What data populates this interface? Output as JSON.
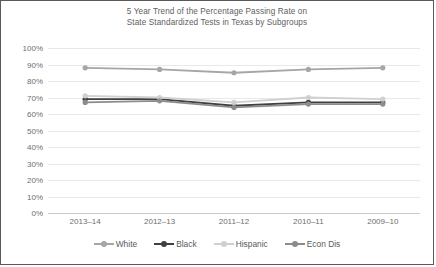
{
  "chart_data": {
    "type": "line",
    "title": "5 Year Trend of the Percentage Passing Rate on State Standardized Tests in Texas by Subgroups",
    "title_line1": "5 Year Trend of the Percentage Passing Rate on",
    "title_line2": "State Standardized Tests in Texas by Subgroups",
    "xlabel": "",
    "ylabel": "",
    "categories": [
      "2013–14",
      "2012–13",
      "2011–12",
      "2010–11",
      "2009–10"
    ],
    "ylim": [
      0,
      100
    ],
    "ytick_labels": [
      "100%",
      "90%",
      "80%",
      "70%",
      "60%",
      "50%",
      "40%",
      "30%",
      "20%",
      "10%",
      "0%"
    ],
    "ytick_values": [
      100,
      90,
      80,
      70,
      60,
      50,
      40,
      30,
      20,
      10,
      0
    ],
    "grid": true,
    "legend_position": "bottom",
    "series": [
      {
        "name": "White",
        "values": [
          88,
          87,
          85,
          87,
          88
        ],
        "color": "#a6a6a6"
      },
      {
        "name": "Black",
        "values": [
          69,
          69,
          65,
          67,
          67
        ],
        "color": "#404040"
      },
      {
        "name": "Hispanic",
        "values": [
          71,
          70,
          67,
          70,
          69
        ],
        "color": "#d0d0d0"
      },
      {
        "name": "Econ Dis",
        "values": [
          67,
          68,
          64,
          66,
          66
        ],
        "color": "#8c8c8c"
      }
    ]
  },
  "legend": {
    "items": [
      {
        "label": "White"
      },
      {
        "label": "Black"
      },
      {
        "label": "Hispanic"
      },
      {
        "label": "Econ Dis"
      }
    ]
  },
  "colors": {
    "grid": "#e8e8e8",
    "axis": "#c9c9c9",
    "text": "#6e6e6e",
    "title": "#606060",
    "border": "#595959"
  }
}
